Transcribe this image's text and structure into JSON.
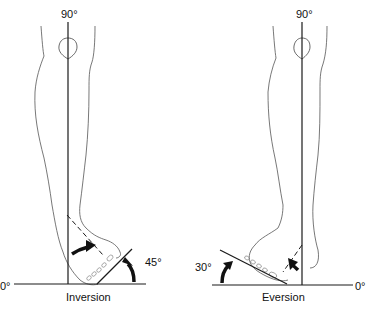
{
  "figures": [
    {
      "id": "inversion",
      "caption": "Inversion",
      "labels": {
        "vertical": "90°",
        "baseline": "0°",
        "angle": "45°"
      }
    },
    {
      "id": "eversion",
      "caption": "Eversion",
      "labels": {
        "vertical": "90°",
        "baseline": "0°",
        "angle": "30°"
      }
    }
  ],
  "colors": {
    "line": "#1a1a1a",
    "outline": "#555555",
    "background": "#ffffff"
  }
}
